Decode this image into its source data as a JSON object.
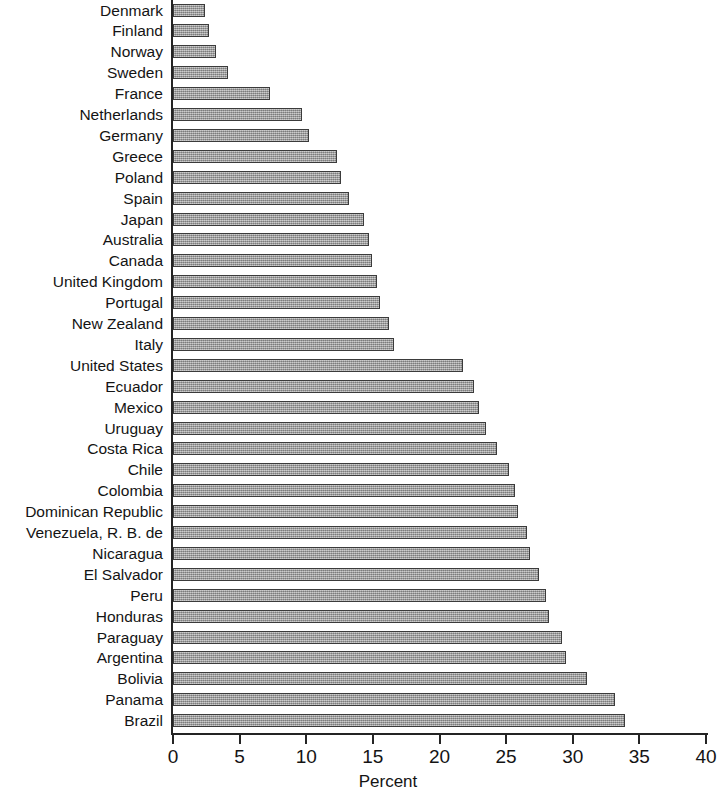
{
  "chart_data": {
    "type": "bar",
    "orientation": "horizontal",
    "title": "",
    "xlabel": "Percent",
    "ylabel": "",
    "xlim": [
      0,
      40
    ],
    "xticks": [
      0,
      5,
      10,
      15,
      20,
      25,
      30,
      35,
      40
    ],
    "grid": false,
    "legend": null,
    "bar_color": "#9d9d9d",
    "bar_edge_color": "#3b3b3b",
    "categories": [
      "Denmark",
      "Finland",
      "Norway",
      "Sweden",
      "France",
      "Netherlands",
      "Germany",
      "Greece",
      "Poland",
      "Spain",
      "Japan",
      "Australia",
      "Canada",
      "United Kingdom",
      "Portugal",
      "New Zealand",
      "Italy",
      "United States",
      "Ecuador",
      "Mexico",
      "Uruguay",
      "Costa Rica",
      "Chile",
      "Colombia",
      "Dominican Republic",
      "Venezuela, R. B. de",
      "Nicaragua",
      "El Salvador",
      "Peru",
      "Honduras",
      "Paraguay",
      "Argentina",
      "Bolivia",
      "Panama",
      "Brazil"
    ],
    "values": [
      2.4,
      2.7,
      3.2,
      4.1,
      7.3,
      9.7,
      10.2,
      12.3,
      12.6,
      13.2,
      14.3,
      14.7,
      14.9,
      15.3,
      15.5,
      16.2,
      16.6,
      21.8,
      22.6,
      23.0,
      23.5,
      24.3,
      25.2,
      25.7,
      25.9,
      26.6,
      26.8,
      27.5,
      28.0,
      28.2,
      29.2,
      29.5,
      31.1,
      33.2,
      33.9
    ]
  }
}
